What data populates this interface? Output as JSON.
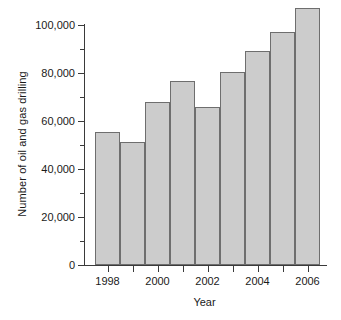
{
  "chart_data": {
    "type": "bar",
    "title": "",
    "xlabel": "Year",
    "ylabel": "Number of oil and gas drilling",
    "categories": [
      "1998",
      "1999",
      "2000",
      "2001",
      "2002",
      "2003",
      "2004",
      "2005",
      "2006"
    ],
    "values": [
      55500,
      51200,
      68000,
      76500,
      66000,
      80500,
      89000,
      97000,
      107000
    ],
    "ylim": [
      0,
      110000
    ],
    "ytick_values": [
      0,
      20000,
      40000,
      60000,
      80000,
      100000
    ],
    "ytick_labels": [
      "0",
      "20,000",
      "40,000",
      "60,000",
      "80,000",
      "100,000"
    ],
    "yminor_tick_values": [
      10000,
      30000,
      50000,
      70000,
      90000
    ],
    "xtick_labels": [
      "1998",
      "",
      "2000",
      "",
      "2002",
      "",
      "2004",
      "",
      "2006"
    ],
    "grid": false,
    "legend": false,
    "bar_fill_color": "#cccccc",
    "bar_edge_color": "#6e6e6e",
    "axis_color": "#3a3a3a",
    "background_color": "#ffffff"
  }
}
